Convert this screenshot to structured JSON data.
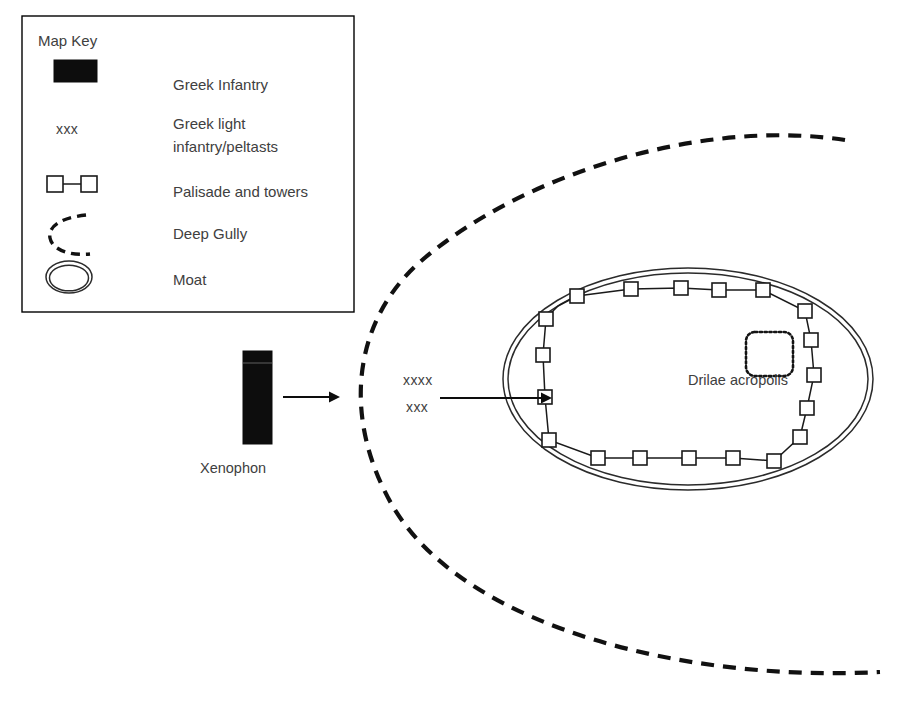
{
  "legend": {
    "title": "Map Key",
    "frame": {
      "x": 22,
      "y": 16,
      "w": 332,
      "h": 296
    },
    "items": [
      {
        "id": "greek-infantry",
        "label": "Greek Infantry",
        "symbol": "filled-rectangle",
        "label_x": 173,
        "label_y": 90
      },
      {
        "id": "greek-light-infantry",
        "label": "Greek light",
        "label2": "infantry/peltasts",
        "symbol": "xxx-text",
        "symbol_text": "xxx",
        "label_x": 173,
        "label_y": 129
      },
      {
        "id": "palisade-and-towers",
        "label": "Palisade and towers",
        "symbol": "two-squares-joined",
        "label_x": 173,
        "label_y": 197
      },
      {
        "id": "deep-gully",
        "label": "Deep Gully",
        "symbol": "dashed-arc",
        "label_x": 173,
        "label_y": 239
      },
      {
        "id": "moat",
        "label": "Moat",
        "symbol": "double-ellipse",
        "label_x": 173,
        "label_y": 285
      }
    ]
  },
  "map": {
    "xenophon": {
      "label": "Xenophon",
      "label_x": 200,
      "label_y": 473,
      "block": {
        "x": 243,
        "y": 351,
        "w": 29,
        "h": 93
      },
      "divider_y": 363,
      "arrow": {
        "x1": 283,
        "y1": 397,
        "x2": 340,
        "y2": 397
      }
    },
    "peltasts": {
      "mark_upper": "xxxx",
      "mark_upper_x": 403,
      "mark_upper_y": 385,
      "mark_lower": "xxx",
      "mark_lower_x": 406,
      "mark_lower_y": 412,
      "arrow": {
        "x1": 440,
        "y1": 398,
        "x2": 552,
        "y2": 398
      }
    },
    "moat": {
      "cx": 688,
      "cy": 379,
      "rx_outer": 185,
      "ry_outer": 111,
      "rx_inner": 180,
      "ry_inner": 106
    },
    "gully": {
      "label": "Deep Gully",
      "path": "M 845 140 C 700 118, 520 175, 420 262 C 352 322, 341 420, 395 510 C 470 630, 690 682, 880 672"
    },
    "acropolis": {
      "label": "Drilae acropolis",
      "label_x": 675,
      "label_y": 385,
      "shape": {
        "x": 746,
        "y": 332,
        "w": 47,
        "h": 44,
        "r": 9
      }
    },
    "palisade": {
      "tower_size": 14,
      "towers": [
        {
          "x": 546,
          "y": 319
        },
        {
          "x": 577,
          "y": 296
        },
        {
          "x": 631,
          "y": 289
        },
        {
          "x": 681,
          "y": 288
        },
        {
          "x": 719,
          "y": 290
        },
        {
          "x": 763,
          "y": 290
        },
        {
          "x": 805,
          "y": 311
        },
        {
          "x": 811,
          "y": 340
        },
        {
          "x": 814,
          "y": 375
        },
        {
          "x": 807,
          "y": 408
        },
        {
          "x": 800,
          "y": 437
        },
        {
          "x": 774,
          "y": 461
        },
        {
          "x": 733,
          "y": 458
        },
        {
          "x": 689,
          "y": 458
        },
        {
          "x": 640,
          "y": 458
        },
        {
          "x": 598,
          "y": 458
        },
        {
          "x": 549,
          "y": 440
        },
        {
          "x": 545,
          "y": 397
        },
        {
          "x": 543,
          "y": 355
        }
      ],
      "link_path": "M 546 319 L 543 355 L 545 397 L 549 440 L 598 458 L 640 458 L 689 458 L 733 458 L 774 461 L 800 437 L 807 408 L 814 375 L 811 340 L 805 311 L 763 290 L 719 290 L 681 288 L 631 289 L 577 296 L 558 306 L 551 313 L 546 319"
    }
  },
  "colors": {
    "ink": "#1a1a1a",
    "text": "#404040",
    "infantry_fill": "#0d0d0d",
    "background": "#ffffff"
  }
}
